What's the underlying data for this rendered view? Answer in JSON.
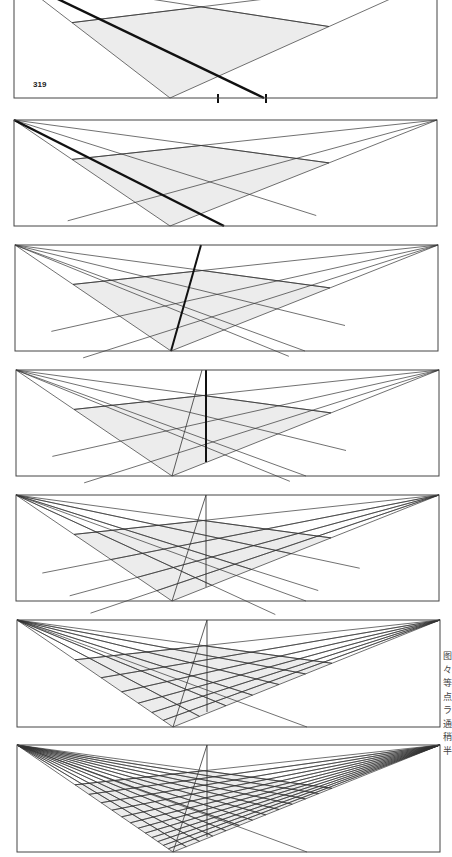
{
  "page": {
    "figure_number": "319",
    "side_text_glyphs": [
      "图",
      "々",
      "等",
      "点",
      "ラ",
      "通",
      "稍",
      "半"
    ]
  },
  "colors": {
    "line": "#333333",
    "thick_line": "#111111",
    "fill": "#ececec",
    "frame": "#444444"
  },
  "panels": [
    {
      "id": 1,
      "x": 14,
      "y": -22,
      "w": 423,
      "h": 120,
      "step": 1,
      "grid": 1,
      "thick": "diagonal",
      "ticks": true,
      "cropped_top": true
    },
    {
      "id": 2,
      "x": 14,
      "y": 120,
      "w": 423,
      "h": 106,
      "step": 2,
      "grid": 2,
      "thick": "diagonal"
    },
    {
      "id": 3,
      "x": 15,
      "y": 245,
      "w": 423,
      "h": 106,
      "step": 3,
      "grid": 3,
      "thick": "slanted"
    },
    {
      "id": 4,
      "x": 16,
      "y": 370,
      "w": 423,
      "h": 106,
      "step": 4,
      "grid": 3,
      "thick": "vertical"
    },
    {
      "id": 5,
      "x": 16,
      "y": 495,
      "w": 423,
      "h": 106,
      "step": 5,
      "grid": 4,
      "thick": "none"
    },
    {
      "id": 6,
      "x": 17,
      "y": 620,
      "w": 423,
      "h": 107,
      "step": 6,
      "grid": 6,
      "thick": "none"
    },
    {
      "id": 7,
      "x": 17,
      "y": 745,
      "w": 423,
      "h": 107,
      "step": 7,
      "grid": 12,
      "thick": "none"
    }
  ]
}
